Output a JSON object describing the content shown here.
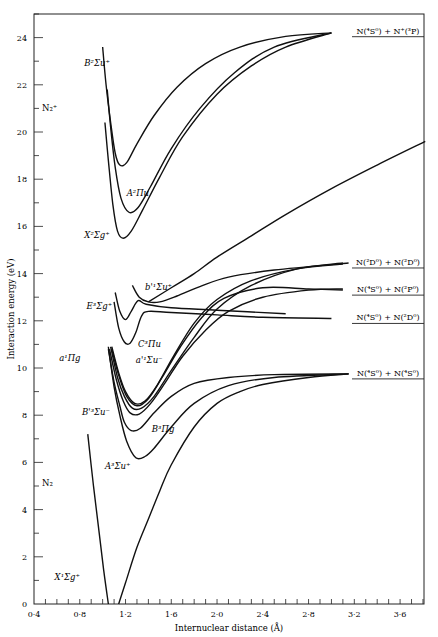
{
  "chart_data": {
    "type": "line",
    "title": "",
    "xlabel": "Internuclear distance (Å)",
    "ylabel": "Interaction energy (eV)",
    "xlim": [
      0.4,
      3.82
    ],
    "ylim": [
      0,
      25.2
    ],
    "grid": false,
    "x_ticks": [
      "0·4",
      "0·8",
      "1·2",
      "1·6",
      "2·0",
      "2·4",
      "2·8",
      "3·2",
      "3·6"
    ],
    "x_tick_values": [
      0.4,
      0.8,
      1.2,
      1.6,
      2.0,
      2.4,
      2.8,
      3.2,
      3.6
    ],
    "y_ticks": [
      "0",
      "2",
      "4",
      "6",
      "8",
      "10",
      "12",
      "14",
      "16",
      "18",
      "20",
      "22",
      "24"
    ],
    "y_tick_values": [
      0,
      2,
      4,
      6,
      8,
      10,
      12,
      14,
      16,
      18,
      20,
      22,
      24
    ],
    "molecule_labels": [
      {
        "text": "N₂⁺",
        "r": 0.47,
        "E": 20.9
      },
      {
        "text": "N₂",
        "r": 0.47,
        "E": 5.0
      }
    ],
    "dissociation_limits": [
      {
        "label": "N(⁴S⁰) + N⁺(³P)",
        "E": 24.25
      },
      {
        "label": "N(²D⁰) + N(²D⁰)",
        "E": 14.45
      },
      {
        "label": "N(⁴S⁰) + N(²P⁰)",
        "E": 13.3
      },
      {
        "label": "N(⁴S⁰) + N(²D⁰)",
        "E": 12.1
      },
      {
        "label": "N(⁴S⁰) + N(⁴S⁰)",
        "E": 9.75
      }
    ],
    "series": [
      {
        "name": "X¹Σg⁺ (N₂ ground)",
        "label_text": "X¹Σg⁺",
        "label_at": [
          0.58,
          1.0
        ],
        "points": [
          [
            0.87,
            7.2
          ],
          [
            0.92,
            5.0
          ],
          [
            0.97,
            3.0
          ],
          [
            1.01,
            1.4
          ],
          [
            1.05,
            0.0
          ]
        ]
      },
      {
        "name": "X¹Σg⁺ right branch",
        "label_text": "",
        "label_at": null,
        "points": [
          [
            1.14,
            0.0
          ],
          [
            1.2,
            0.9
          ],
          [
            1.3,
            2.4
          ],
          [
            1.4,
            3.6
          ],
          [
            1.5,
            4.8
          ],
          [
            1.6,
            5.9
          ],
          [
            1.8,
            7.5
          ],
          [
            2.0,
            8.5
          ],
          [
            2.2,
            9.0
          ],
          [
            2.4,
            9.3
          ],
          [
            2.8,
            9.6
          ],
          [
            3.15,
            9.75
          ]
        ]
      },
      {
        "name": "A³Σu⁺",
        "label_text": "A³Σu⁺",
        "label_at": [
          1.02,
          5.7
        ],
        "points": [
          [
            1.05,
            10.9
          ],
          [
            1.1,
            9.2
          ],
          [
            1.15,
            8.0
          ],
          [
            1.21,
            6.9
          ],
          [
            1.29,
            6.2
          ],
          [
            1.37,
            6.25
          ],
          [
            1.45,
            6.6
          ],
          [
            1.6,
            7.5
          ],
          [
            1.8,
            8.5
          ],
          [
            2.1,
            9.25
          ],
          [
            2.5,
            9.6
          ],
          [
            3.15,
            9.75
          ]
        ]
      },
      {
        "name": "B³Πg",
        "label_text": "B³Πg",
        "label_at": [
          1.43,
          7.3
        ],
        "points": [
          [
            1.05,
            10.8
          ],
          [
            1.1,
            9.4
          ],
          [
            1.15,
            8.4
          ],
          [
            1.19,
            7.7
          ],
          [
            1.25,
            7.35
          ],
          [
            1.33,
            7.45
          ],
          [
            1.45,
            8.1
          ],
          [
            1.6,
            8.8
          ],
          [
            1.8,
            9.35
          ],
          [
            2.1,
            9.6
          ],
          [
            2.5,
            9.72
          ],
          [
            3.15,
            9.75
          ]
        ]
      },
      {
        "name": "B'³Σu⁻",
        "label_text": "B'³Σu⁻",
        "label_at": [
          0.82,
          8.0
        ],
        "points": [
          [
            1.06,
            10.8
          ],
          [
            1.12,
            9.5
          ],
          [
            1.18,
            8.6
          ],
          [
            1.24,
            8.1
          ],
          [
            1.32,
            8.05
          ],
          [
            1.42,
            8.5
          ],
          [
            1.55,
            9.4
          ],
          [
            1.7,
            10.5
          ],
          [
            1.9,
            11.6
          ],
          [
            2.1,
            12.4
          ],
          [
            2.4,
            13.0
          ],
          [
            2.8,
            13.3
          ],
          [
            3.1,
            13.35
          ]
        ]
      },
      {
        "name": "a'¹Σu⁻",
        "label_text": "a'¹Σu⁻",
        "label_at": [
          1.29,
          10.2
        ],
        "points": [
          [
            1.07,
            10.9
          ],
          [
            1.13,
            9.6
          ],
          [
            1.19,
            8.8
          ],
          [
            1.26,
            8.3
          ],
          [
            1.34,
            8.3
          ],
          [
            1.45,
            8.8
          ],
          [
            1.6,
            9.9
          ],
          [
            1.8,
            11.3
          ],
          [
            2.0,
            12.5
          ],
          [
            2.3,
            13.5
          ],
          [
            2.7,
            14.2
          ],
          [
            3.1,
            14.45
          ]
        ]
      },
      {
        "name": "a¹Πg",
        "label_text": "a¹Πg",
        "label_at": [
          0.62,
          10.3
        ],
        "points": [
          [
            1.08,
            10.9
          ],
          [
            1.14,
            9.8
          ],
          [
            1.2,
            9.0
          ],
          [
            1.28,
            8.5
          ],
          [
            1.37,
            8.6
          ],
          [
            1.48,
            9.3
          ],
          [
            1.62,
            10.5
          ],
          [
            1.8,
            11.9
          ],
          [
            2.0,
            12.9
          ],
          [
            2.3,
            13.7
          ],
          [
            2.7,
            14.2
          ],
          [
            3.1,
            14.4
          ]
        ]
      },
      {
        "name": "W³Δu (unlabelled)",
        "label_text": "",
        "label_at": null,
        "points": [
          [
            1.08,
            10.8
          ],
          [
            1.14,
            9.7
          ],
          [
            1.21,
            8.8
          ],
          [
            1.3,
            8.4
          ],
          [
            1.4,
            8.7
          ],
          [
            1.52,
            9.6
          ],
          [
            1.68,
            10.9
          ],
          [
            1.86,
            12.1
          ],
          [
            2.06,
            12.95
          ],
          [
            2.4,
            13.4
          ],
          [
            2.8,
            13.35
          ],
          [
            3.1,
            13.3
          ]
        ]
      },
      {
        "name": "C³Πu",
        "label_text": "C³Πu",
        "label_at": [
          1.31,
          10.9
        ],
        "points": [
          [
            1.1,
            12.8
          ],
          [
            1.14,
            11.7
          ],
          [
            1.19,
            11.1
          ],
          [
            1.24,
            11.05
          ],
          [
            1.29,
            11.5
          ],
          [
            1.34,
            12.2
          ],
          [
            1.4,
            12.4
          ],
          [
            1.6,
            12.35
          ],
          [
            2.0,
            12.25
          ],
          [
            2.4,
            12.15
          ],
          [
            3.0,
            12.1
          ]
        ]
      },
      {
        "name": "E³Σg⁺",
        "label_text": "E³Σg⁺",
        "label_at": [
          0.86,
          12.5
        ],
        "points": [
          [
            1.11,
            13.2
          ],
          [
            1.15,
            12.4
          ],
          [
            1.2,
            12.05
          ],
          [
            1.25,
            12.4
          ],
          [
            1.31,
            12.85
          ],
          [
            1.38,
            12.7
          ],
          [
            1.6,
            12.55
          ],
          [
            2.0,
            12.45
          ],
          [
            2.6,
            12.3
          ]
        ]
      },
      {
        "name": "b'¹Σu⁺",
        "label_text": "b'¹Σu⁺",
        "label_at": [
          1.37,
          13.3
        ],
        "points": [
          [
            1.26,
            13.5
          ],
          [
            1.32,
            13.0
          ],
          [
            1.4,
            12.8
          ],
          [
            1.5,
            12.8
          ],
          [
            1.65,
            13.05
          ],
          [
            1.85,
            13.45
          ],
          [
            2.1,
            13.85
          ],
          [
            2.5,
            14.15
          ],
          [
            3.15,
            14.45
          ]
        ]
      },
      {
        "name": "Repulsive state to N(⁴S⁰)+N⁺(³P) region",
        "label_text": "",
        "label_at": null,
        "points": [
          [
            1.4,
            12.8
          ],
          [
            1.6,
            13.4
          ],
          [
            1.8,
            14.0
          ],
          [
            2.0,
            14.7
          ],
          [
            2.3,
            15.6
          ],
          [
            2.6,
            16.5
          ],
          [
            3.0,
            17.6
          ],
          [
            3.4,
            18.6
          ],
          [
            3.82,
            19.6
          ]
        ]
      },
      {
        "name": "X²Σg⁺ (N₂⁺)",
        "label_text": "X²Σg⁺",
        "label_at": [
          0.84,
          15.5
        ],
        "points": [
          [
            1.02,
            20.4
          ],
          [
            1.05,
            18.8
          ],
          [
            1.09,
            16.9
          ],
          [
            1.13,
            15.8
          ],
          [
            1.18,
            15.5
          ],
          [
            1.25,
            15.8
          ],
          [
            1.35,
            16.7
          ],
          [
            1.5,
            18.1
          ],
          [
            1.7,
            19.8
          ],
          [
            2.0,
            21.6
          ],
          [
            2.3,
            22.8
          ],
          [
            2.6,
            23.6
          ],
          [
            3.0,
            24.2
          ]
        ]
      },
      {
        "name": "A²Πu (N₂⁺)",
        "label_text": "A²Πu",
        "label_at": [
          1.21,
          17.3
        ],
        "points": [
          [
            1.04,
            21.8
          ],
          [
            1.07,
            20.2
          ],
          [
            1.11,
            18.5
          ],
          [
            1.16,
            17.2
          ],
          [
            1.23,
            16.6
          ],
          [
            1.31,
            16.8
          ],
          [
            1.42,
            17.7
          ],
          [
            1.6,
            19.3
          ],
          [
            1.85,
            21.0
          ],
          [
            2.15,
            22.5
          ],
          [
            2.5,
            23.6
          ],
          [
            3.0,
            24.2
          ]
        ]
      },
      {
        "name": "B²Σu⁺ (N₂⁺)",
        "label_text": "B²Σu⁺",
        "label_at": [
          0.84,
          22.8
        ],
        "points": [
          [
            1.0,
            23.6
          ],
          [
            1.03,
            22.0
          ],
          [
            1.07,
            20.4
          ],
          [
            1.11,
            19.1
          ],
          [
            1.15,
            18.6
          ],
          [
            1.21,
            18.7
          ],
          [
            1.3,
            19.5
          ],
          [
            1.45,
            20.7
          ],
          [
            1.65,
            21.9
          ],
          [
            1.9,
            22.9
          ],
          [
            2.2,
            23.6
          ],
          [
            2.6,
            24.05
          ],
          [
            3.0,
            24.2
          ]
        ]
      }
    ]
  }
}
